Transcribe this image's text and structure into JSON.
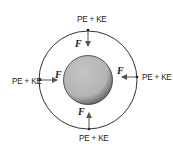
{
  "diagram": {
    "labels": {
      "top": "PE + KE",
      "left": "PE + KE",
      "right": "PE + KE",
      "bottom": "PE + KE"
    },
    "forces": {
      "top": "F",
      "left": "F",
      "right": "F",
      "bottom": "F"
    },
    "colors": {
      "planet_fill": "#b8b8b8",
      "line": "#333333",
      "arrow": "#555555"
    }
  }
}
